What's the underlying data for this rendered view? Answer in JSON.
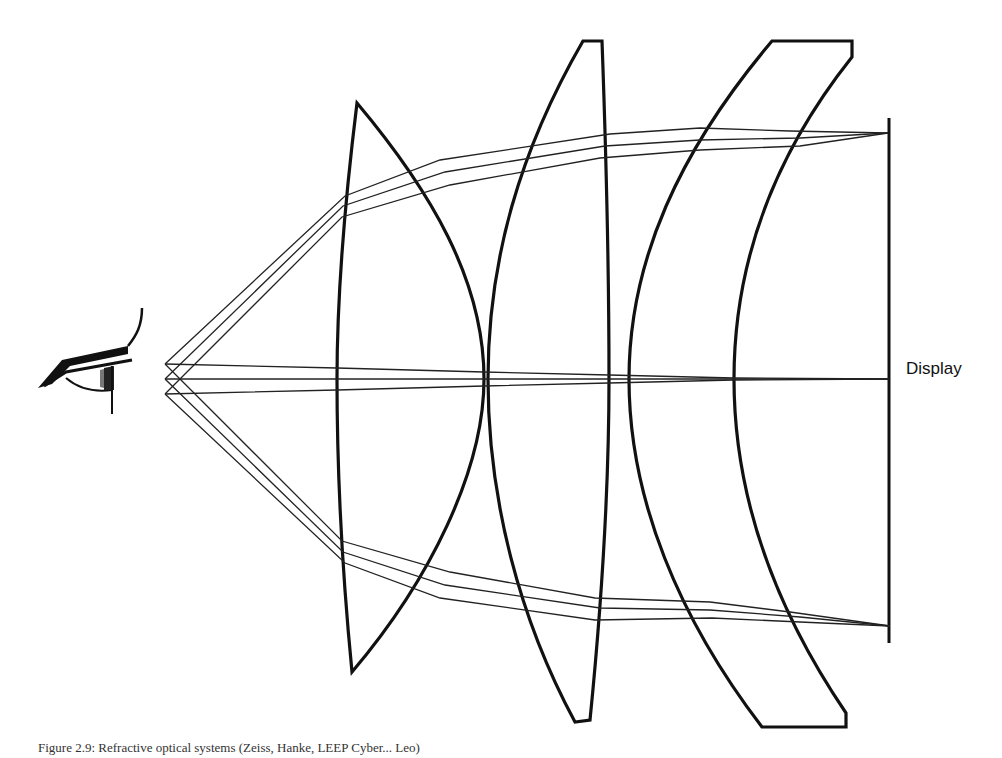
{
  "diagram": {
    "type": "optical-ray-diagram",
    "labels": {
      "display": "Display"
    },
    "caption": "Figure 2.9: Refractive optical systems (Zeiss, Hanke, LEEP Cyber... Leo)",
    "elements": [
      {
        "id": "eye",
        "kind": "eye",
        "position": [
          90,
          360
        ]
      },
      {
        "id": "lens-1",
        "kind": "plano-convex",
        "x_range": [
          337,
          484
        ]
      },
      {
        "id": "lens-2",
        "kind": "biconvex",
        "x_range": [
          488,
          609
        ]
      },
      {
        "id": "lens-3",
        "kind": "meniscus",
        "x_range": [
          629,
          852
        ]
      },
      {
        "id": "display",
        "kind": "screen",
        "x": 889,
        "y_range": [
          118,
          643
        ]
      }
    ],
    "ray_bundles": [
      {
        "name": "top-field",
        "focus": [
          888,
          133
        ]
      },
      {
        "name": "center-field",
        "focus": [
          889,
          379
        ]
      },
      {
        "name": "bottom-field",
        "focus": [
          890,
          626
        ]
      }
    ],
    "pupil_points": [
      [
        165,
        364
      ],
      [
        165,
        379
      ],
      [
        165,
        394
      ]
    ]
  }
}
